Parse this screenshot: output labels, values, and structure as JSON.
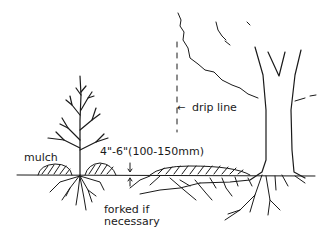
{
  "diagram": {
    "title": "",
    "labels": {
      "mulch": "mulch",
      "depth": "4\"-6\"(100-150mm)",
      "drip_line": "drip line",
      "drip_arrow": "←",
      "forked_line1": "forked if",
      "forked_line2": "necessary"
    },
    "elements": [
      "young tree with bare branches and roots",
      "mulch mounds around young tree",
      "mature tree trunk with canopy outline",
      "dashed drip line from canopy edge",
      "large mulch mound extending to drip line",
      "ground line",
      "spreading roots of mature tree",
      "depth arrows indicating mulch thickness"
    ],
    "colors": {
      "ink": "#1a1a1a",
      "background": "#ffffff"
    }
  }
}
